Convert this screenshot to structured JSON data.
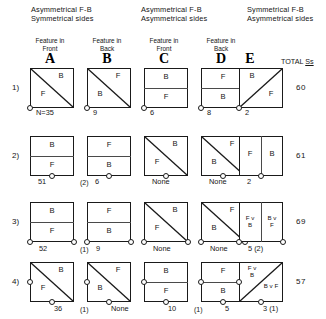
{
  "figure": {
    "groups": [
      {
        "id": "group-1",
        "text": "Asymmetrical F-B\nSymmetrical sides"
      },
      {
        "id": "group-2",
        "text": "Asymmetrical F-B\nAsymmetrical sides"
      },
      {
        "id": "group-3",
        "text": "Symmetrical F-B\nAsymmetrical sides"
      }
    ],
    "columns": [
      {
        "letter": "A",
        "caption": "Feature in\nFront"
      },
      {
        "letter": "B",
        "caption": "Feature in\nBack"
      },
      {
        "letter": "C",
        "caption": "Feature in\nFront"
      },
      {
        "letter": "D",
        "caption": "Feature in\nBack"
      },
      {
        "letter": "E",
        "caption": ""
      }
    ],
    "total_header": "TOTAL Ss",
    "total_header_plain": "TOTAL ",
    "total_header_underlined": "Ss",
    "rows": [
      {
        "label": "1)",
        "total": "60",
        "cells": [
          {
            "col": "A",
            "split": "diag-tlbr",
            "labels": [
              "B",
              "F"
            ],
            "count": "N=35",
            "paren": ""
          },
          {
            "col": "B",
            "split": "diag-tlbr",
            "labels": [
              "F",
              "B"
            ],
            "count": "9",
            "paren": ""
          },
          {
            "col": "C",
            "split": "horizontal",
            "labels": [
              "B",
              "F"
            ],
            "count": "6",
            "paren": ""
          },
          {
            "col": "D",
            "split": "horizontal",
            "labels": [
              "F",
              "B"
            ],
            "count": "8",
            "paren": ""
          },
          {
            "col": "E",
            "split": "diag-blbr",
            "labels": [
              "B",
              "F"
            ],
            "count": "2",
            "paren": ""
          }
        ]
      },
      {
        "label": "2)",
        "total": "61",
        "cells": [
          {
            "col": "A",
            "split": "horizontal",
            "labels": [
              "B",
              "F"
            ],
            "count": "51",
            "paren": "(2)"
          },
          {
            "col": "B",
            "split": "horizontal",
            "labels": [
              "F",
              "B"
            ],
            "count": "6",
            "paren": ""
          },
          {
            "col": "C",
            "split": "diag-tlbr",
            "labels": [
              "B",
              "F"
            ],
            "count": "None",
            "paren": ""
          },
          {
            "col": "D",
            "split": "diag-tlbr",
            "labels": [
              "F",
              "B"
            ],
            "count": "None",
            "paren": ""
          },
          {
            "col": "E",
            "split": "vertical",
            "labels": [
              "F",
              "B"
            ],
            "count": "2",
            "paren": ""
          }
        ]
      },
      {
        "label": "3)",
        "total": "69",
        "cells": [
          {
            "col": "A",
            "split": "horizontal",
            "labels": [
              "B",
              "F"
            ],
            "count": "52",
            "paren": "(1)"
          },
          {
            "col": "B",
            "split": "horizontal",
            "labels": [
              "F",
              "B"
            ],
            "count": "9",
            "paren": ""
          },
          {
            "col": "C",
            "split": "diag-tlbr",
            "labels": [
              "B",
              "F"
            ],
            "count": "None",
            "paren": ""
          },
          {
            "col": "D",
            "split": "diag-tlbr",
            "labels": [
              "F",
              "B"
            ],
            "count": "None",
            "paren": ""
          },
          {
            "col": "E",
            "split": "vertical",
            "labels": [
              "F v\nB",
              "B v\nF"
            ],
            "count": "5 (2)",
            "paren": ""
          }
        ]
      },
      {
        "label": "4)",
        "total": "57",
        "cells": [
          {
            "col": "A",
            "split": "diag-tlbr",
            "labels": [
              "B",
              "F"
            ],
            "count": "36",
            "paren": "(1)"
          },
          {
            "col": "B",
            "split": "diag-tlbr",
            "labels": [
              "F",
              "B"
            ],
            "count": "None",
            "paren": ""
          },
          {
            "col": "C",
            "split": "horizontal",
            "labels": [
              "B",
              "F"
            ],
            "count": "10",
            "paren": "(1)"
          },
          {
            "col": "D",
            "split": "horizontal",
            "labels": [
              "F",
              "B"
            ],
            "count": "5",
            "paren": ""
          },
          {
            "col": "E",
            "split": "diag-blbr",
            "labels": [
              "F v\nB",
              "B v F"
            ],
            "count": "3 (1)",
            "paren": ""
          }
        ]
      }
    ]
  }
}
